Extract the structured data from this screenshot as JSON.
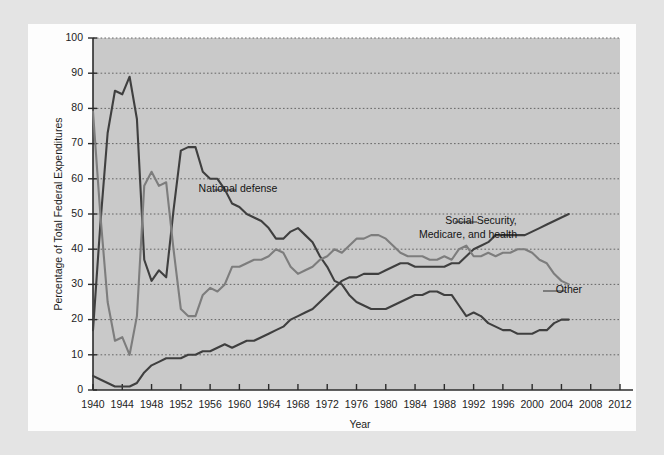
{
  "figure": {
    "background_color": "#e4e4e4",
    "paper_color": "#fdfdfd",
    "plot_background_color": "#c9c9c9"
  },
  "chart_data": {
    "type": "line",
    "title": "",
    "xlabel": "Year",
    "ylabel": "Percentage of Total Federal Expenditures",
    "xlim": [
      1940,
      2012
    ],
    "ylim": [
      0,
      100
    ],
    "grid": true,
    "legend_position": "inline-annotations",
    "xticks": [
      1940,
      1944,
      1948,
      1952,
      1956,
      1960,
      1964,
      1968,
      1972,
      1976,
      1980,
      1984,
      1988,
      1992,
      1996,
      2000,
      2004,
      2008,
      2012
    ],
    "yticks": [
      0,
      10,
      20,
      30,
      40,
      50,
      60,
      70,
      80,
      90,
      100
    ],
    "x": [
      1940,
      1941,
      1942,
      1943,
      1944,
      1945,
      1946,
      1947,
      1948,
      1949,
      1950,
      1951,
      1952,
      1953,
      1954,
      1955,
      1956,
      1957,
      1958,
      1959,
      1960,
      1961,
      1962,
      1963,
      1964,
      1965,
      1966,
      1967,
      1968,
      1969,
      1970,
      1971,
      1972,
      1973,
      1974,
      1975,
      1976,
      1977,
      1978,
      1979,
      1980,
      1981,
      1982,
      1983,
      1984,
      1985,
      1986,
      1987,
      1988,
      1989,
      1990,
      1991,
      1992,
      1993,
      1994,
      1995,
      1996,
      1997,
      1998,
      1999,
      2000,
      2001,
      2002,
      2003,
      2004,
      2005
    ],
    "series": [
      {
        "name": "National defense",
        "color": "#3f3f3f",
        "label_position": {
          "x": 1957,
          "y": 58
        },
        "values": [
          17,
          47,
          73,
          85,
          84,
          89,
          77,
          37,
          31,
          34,
          32,
          51,
          68,
          69,
          69,
          62,
          60,
          60,
          57,
          53,
          52,
          50,
          49,
          48,
          46,
          43,
          43,
          45,
          46,
          44,
          42,
          38,
          35,
          31,
          30,
          27,
          25,
          24,
          23,
          23,
          23,
          24,
          25,
          26,
          27,
          27,
          28,
          28,
          27,
          27,
          24,
          21,
          22,
          21,
          19,
          18,
          17,
          17,
          16,
          16,
          16,
          17,
          17,
          19,
          20,
          20
        ]
      },
      {
        "name": "Social Security, Medicare, and health",
        "color": "#3f3f3f",
        "label_position": {
          "x": 1988,
          "y": 45
        },
        "values": [
          4,
          3,
          2,
          1,
          1,
          1,
          2,
          5,
          7,
          8,
          9,
          9,
          9,
          10,
          10,
          11,
          11,
          12,
          13,
          12,
          13,
          14,
          14,
          15,
          16,
          17,
          18,
          20,
          21,
          22,
          23,
          25,
          27,
          29,
          31,
          32,
          32,
          33,
          33,
          33,
          34,
          35,
          36,
          36,
          35,
          35,
          35,
          35,
          35,
          36,
          36,
          38,
          40,
          41,
          42,
          44,
          44,
          44,
          44,
          44,
          45,
          46,
          47,
          48,
          49,
          50
        ]
      },
      {
        "name": "Other",
        "color": "#7d7d7d",
        "label_position": {
          "x": 2004,
          "y": 27
        },
        "values": [
          79,
          50,
          25,
          14,
          15,
          10,
          21,
          58,
          62,
          58,
          59,
          40,
          23,
          21,
          21,
          27,
          29,
          28,
          30,
          35,
          35,
          36,
          37,
          37,
          38,
          40,
          39,
          35,
          33,
          34,
          35,
          37,
          38,
          40,
          39,
          41,
          43,
          43,
          44,
          44,
          43,
          41,
          39,
          38,
          38,
          38,
          37,
          37,
          38,
          37,
          40,
          41,
          38,
          38,
          39,
          38,
          39,
          39,
          40,
          40,
          39,
          37,
          36,
          33,
          31,
          30
        ]
      }
    ],
    "annotations": [
      {
        "text": "National defense",
        "x_px": 238,
        "y_px": 192
      },
      {
        "text": "Social Security,",
        "x_px": 481,
        "y_px": 224
      },
      {
        "text": "Medicare, and health",
        "x_px": 468,
        "y_px": 238
      },
      {
        "text": "Other",
        "x_px": 569,
        "y_px": 293
      }
    ]
  },
  "axes": {
    "y_axis_title": "Percentage of Total Federal Expenditures",
    "x_axis_title": "Year"
  }
}
